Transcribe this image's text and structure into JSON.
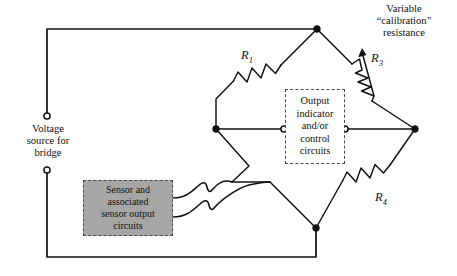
{
  "diagram": {
    "colors": {
      "wire": "#111111",
      "sensor_box_fill": "#a6a6a6",
      "dashed_border": "#4a4a4a",
      "background": "#ffffff"
    }
  },
  "labels": {
    "variable_calibration": "Variable\n“calibration”\nresistance",
    "voltage_source": "Voltage\nsource for\nbridge",
    "output_indicator": "Output\nindicator\nand/or\ncontrol\ncircuits",
    "sensor_circuits": "Sensor and\nassociated\nsensor output\ncircuits"
  },
  "resistors": [
    {
      "id": "R1",
      "name": "R₁",
      "letter": "R",
      "subscript": "1",
      "type": "fixed",
      "leg": "top-left"
    },
    {
      "id": "R3",
      "name": "R₃",
      "letter": "R",
      "subscript": "3",
      "type": "variable",
      "leg": "top-right"
    },
    {
      "id": "R4",
      "name": "R₄",
      "letter": "R",
      "subscript": "4",
      "type": "fixed",
      "leg": "bottom-right"
    }
  ],
  "nodes": [
    {
      "name": "top-apex",
      "x": 317,
      "y": 29,
      "kind": "junction"
    },
    {
      "name": "left-node",
      "x": 216,
      "y": 129,
      "kind": "junction"
    },
    {
      "name": "right-node",
      "x": 415,
      "y": 129,
      "kind": "junction"
    },
    {
      "name": "bottom-apex",
      "x": 316,
      "y": 228,
      "kind": "junction"
    },
    {
      "name": "voltage-terminal-top",
      "x": 47,
      "y": 116,
      "kind": "open-terminal"
    },
    {
      "name": "voltage-terminal-bottom",
      "x": 47,
      "y": 170,
      "kind": "open-terminal"
    },
    {
      "name": "output-terminal-left",
      "x": 284,
      "y": 129,
      "kind": "open-terminal"
    },
    {
      "name": "output-terminal-right",
      "x": 345,
      "y": 129,
      "kind": "open-terminal"
    }
  ],
  "icons": {
    "arrow_up": "variable-resistor-arrow-icon",
    "squiggle": "flexible-lead-icon"
  }
}
